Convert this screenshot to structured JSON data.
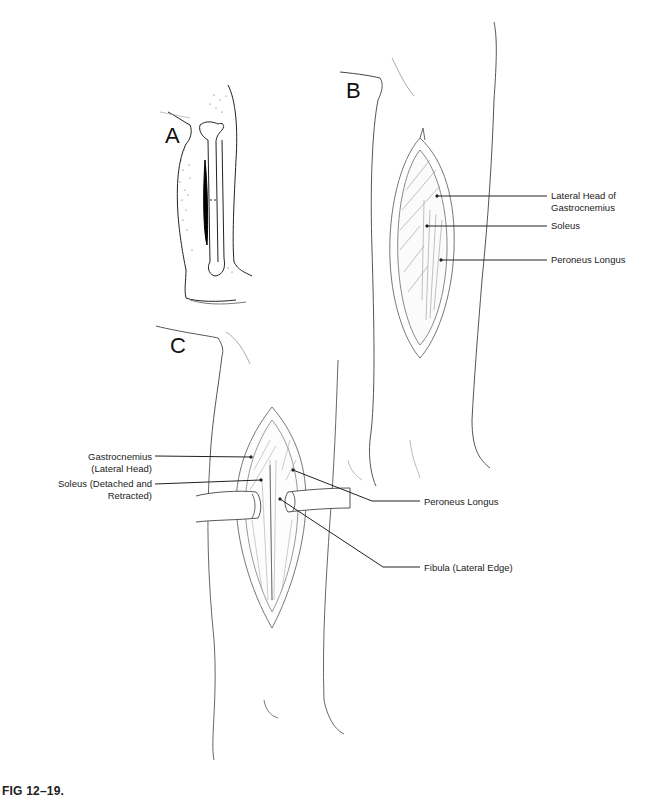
{
  "figure": {
    "caption": "FIG 12–19.",
    "panels": {
      "A": {
        "letter": "A"
      },
      "B": {
        "letter": "B",
        "labels": [
          {
            "id": "b-lateral-head-line1",
            "text": "Lateral Head of"
          },
          {
            "id": "b-lateral-head-line2",
            "text": "Gastrocnemius"
          },
          {
            "id": "b-soleus",
            "text": "Soleus"
          },
          {
            "id": "b-peroneus-longus",
            "text": "Peroneus Longus"
          }
        ]
      },
      "C": {
        "letter": "C",
        "labels": [
          {
            "id": "c-gastroc-line1",
            "text": "Gastrocnemius"
          },
          {
            "id": "c-gastroc-line2",
            "text": "(Lateral Head)"
          },
          {
            "id": "c-soleus-line1",
            "text": "Soleus (Detached and"
          },
          {
            "id": "c-soleus-line2",
            "text": "Retracted)"
          },
          {
            "id": "c-peroneus-longus",
            "text": "Peroneus Longus"
          },
          {
            "id": "c-fibula",
            "text": "Fibula (Lateral Edge)"
          }
        ]
      }
    },
    "colors": {
      "ink": "#1a1a1a",
      "pencil": "#6a6a6a",
      "light_pencil": "#b0b0b0",
      "incision": "#000000"
    }
  }
}
